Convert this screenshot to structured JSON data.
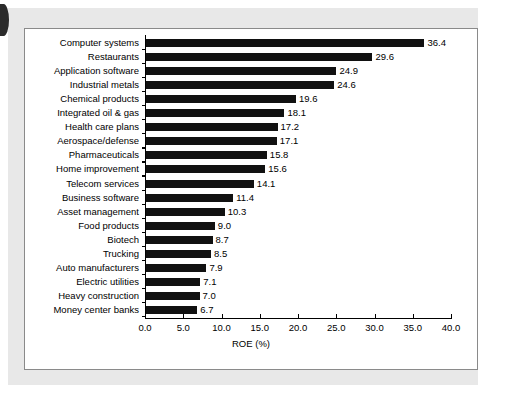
{
  "chart_data": {
    "type": "bar",
    "orientation": "horizontal",
    "title": "",
    "xlabel": "ROE (%)",
    "ylabel": "",
    "xlim": [
      0.0,
      40.0
    ],
    "xticks": [
      "0.0",
      "5.0",
      "10.0",
      "15.0",
      "20.0",
      "25.0",
      "30.0",
      "35.0",
      "40.0"
    ],
    "xtick_step": 5.0,
    "grid": false,
    "legend": null,
    "bar_color": "#111111",
    "categories": [
      "Computer systems",
      "Restaurants",
      "Application software",
      "Industrial metals",
      "Chemical products",
      "Integrated oil & gas",
      "Health care plans",
      "Aerospace/defense",
      "Pharmaceuticals",
      "Home improvement",
      "Telecom services",
      "Business software",
      "Asset management",
      "Food products",
      "Biotech",
      "Trucking",
      "Auto manufacturers",
      "Electric utilities",
      "Heavy construction",
      "Money center banks"
    ],
    "values": [
      36.4,
      29.6,
      24.9,
      24.6,
      19.6,
      18.1,
      17.2,
      17.1,
      15.8,
      15.6,
      14.1,
      11.4,
      10.3,
      9.0,
      8.7,
      8.5,
      7.9,
      7.1,
      7.0,
      6.7
    ],
    "value_labels": [
      "36.4",
      "29.6",
      "24.9",
      "24.6",
      "19.6",
      "18.1",
      "17.2",
      "17.1",
      "15.8",
      "15.6",
      "14.1",
      "11.4",
      "10.3",
      "9.0",
      "8.7",
      "8.5",
      "7.9",
      "7.1",
      "7.0",
      "6.7"
    ]
  }
}
